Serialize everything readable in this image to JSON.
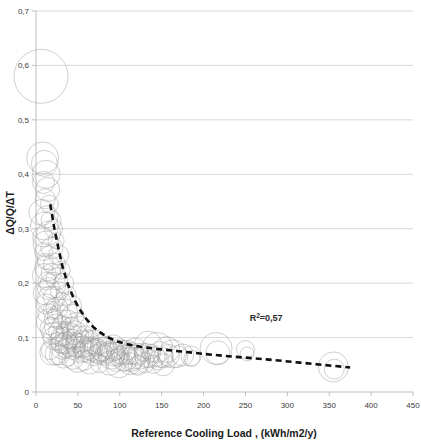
{
  "chart_data": {
    "type": "scatter",
    "title": "",
    "xlabel": "Reference Cooling Load , (kWh/m2/y)",
    "ylabel": "ΔQ/Q/ΔT",
    "xlim": [
      0,
      450
    ],
    "ylim": [
      0,
      0.7
    ],
    "xticks": [
      "0",
      "50",
      "100",
      "150",
      "200",
      "250",
      "300",
      "350",
      "400",
      "450"
    ],
    "xtick_values": [
      0,
      50,
      100,
      150,
      200,
      250,
      300,
      350,
      400,
      450
    ],
    "yticks": [
      "0",
      "0,1",
      "0,2",
      "0,3",
      "0,4",
      "0,5",
      "0,6",
      "0,7"
    ],
    "ytick_values": [
      0,
      0.1,
      0.2,
      0.3,
      0.4,
      0.5,
      0.6,
      0.7
    ],
    "grid": "horizontal",
    "legend": "none",
    "marker_style": "open-circle-outline",
    "marker_color": "#9a9a9a",
    "annotations": [
      {
        "text": "R²=0,57",
        "x": 255,
        "y": 0.13,
        "base": "R",
        "sup": "2",
        "rest": "=0,57"
      }
    ],
    "trendline": {
      "style": "dashed",
      "color": "#111111",
      "label": "power-law decay fit",
      "points": [
        [
          17,
          0.345
        ],
        [
          22,
          0.3
        ],
        [
          27,
          0.262
        ],
        [
          32,
          0.228
        ],
        [
          38,
          0.198
        ],
        [
          45,
          0.172
        ],
        [
          52,
          0.152
        ],
        [
          60,
          0.134
        ],
        [
          68,
          0.12
        ],
        [
          76,
          0.11
        ],
        [
          85,
          0.101
        ],
        [
          95,
          0.094
        ],
        [
          108,
          0.088
        ],
        [
          125,
          0.083
        ],
        [
          145,
          0.079
        ],
        [
          170,
          0.075
        ],
        [
          200,
          0.07
        ],
        [
          235,
          0.065
        ],
        [
          275,
          0.06
        ],
        [
          315,
          0.054
        ],
        [
          355,
          0.048
        ],
        [
          375,
          0.045
        ]
      ]
    },
    "series": [
      {
        "name": "Buildings",
        "x_label": "Reference Cooling Load (kWh/m2/y)",
        "y_label": "ΔQ/Q/ΔT",
        "points": [
          [
            6,
            0.58,
            27
          ],
          [
            8,
            0.43,
            16
          ],
          [
            10,
            0.42,
            13
          ],
          [
            12,
            0.4,
            14
          ],
          [
            9,
            0.385,
            11
          ],
          [
            14,
            0.372,
            12
          ],
          [
            11,
            0.355,
            10
          ],
          [
            16,
            0.345,
            9
          ],
          [
            7,
            0.33,
            13
          ],
          [
            13,
            0.322,
            11
          ],
          [
            18,
            0.315,
            10
          ],
          [
            10,
            0.305,
            14
          ],
          [
            21,
            0.3,
            9
          ],
          [
            15,
            0.292,
            12
          ],
          [
            8,
            0.285,
            10
          ],
          [
            24,
            0.278,
            8
          ],
          [
            12,
            0.272,
            13
          ],
          [
            19,
            0.265,
            11
          ],
          [
            9,
            0.258,
            9
          ],
          [
            27,
            0.252,
            10
          ],
          [
            16,
            0.246,
            12
          ],
          [
            11,
            0.24,
            8
          ],
          [
            22,
            0.235,
            11
          ],
          [
            14,
            0.228,
            13
          ],
          [
            30,
            0.224,
            9
          ],
          [
            18,
            0.218,
            10
          ],
          [
            10,
            0.214,
            12
          ],
          [
            25,
            0.208,
            11
          ],
          [
            13,
            0.204,
            9
          ],
          [
            33,
            0.2,
            10
          ],
          [
            20,
            0.196,
            13
          ],
          [
            15,
            0.19,
            11
          ],
          [
            28,
            0.186,
            9
          ],
          [
            11,
            0.182,
            12
          ],
          [
            36,
            0.178,
            10
          ],
          [
            22,
            0.174,
            11
          ],
          [
            17,
            0.17,
            13
          ],
          [
            31,
            0.166,
            9
          ],
          [
            12,
            0.162,
            10
          ],
          [
            40,
            0.158,
            12
          ],
          [
            25,
            0.154,
            11
          ],
          [
            19,
            0.15,
            9
          ],
          [
            34,
            0.147,
            13
          ],
          [
            14,
            0.144,
            10
          ],
          [
            44,
            0.141,
            11
          ],
          [
            28,
            0.138,
            12
          ],
          [
            21,
            0.135,
            9
          ],
          [
            38,
            0.132,
            10
          ],
          [
            16,
            0.129,
            13
          ],
          [
            48,
            0.126,
            11
          ],
          [
            31,
            0.124,
            9
          ],
          [
            24,
            0.121,
            12
          ],
          [
            42,
            0.119,
            10
          ],
          [
            18,
            0.117,
            11
          ],
          [
            53,
            0.115,
            13
          ],
          [
            35,
            0.113,
            9
          ],
          [
            27,
            0.111,
            10
          ],
          [
            46,
            0.109,
            12
          ],
          [
            20,
            0.107,
            11
          ],
          [
            58,
            0.105,
            9
          ],
          [
            39,
            0.104,
            13
          ],
          [
            30,
            0.102,
            10
          ],
          [
            50,
            0.101,
            11
          ],
          [
            23,
            0.099,
            12
          ],
          [
            64,
            0.098,
            9
          ],
          [
            43,
            0.097,
            10
          ],
          [
            33,
            0.095,
            13
          ],
          [
            55,
            0.094,
            11
          ],
          [
            26,
            0.093,
            9
          ],
          [
            70,
            0.092,
            12
          ],
          [
            47,
            0.091,
            10
          ],
          [
            36,
            0.09,
            11
          ],
          [
            60,
            0.089,
            13
          ],
          [
            29,
            0.088,
            9
          ],
          [
            77,
            0.087,
            10
          ],
          [
            51,
            0.086,
            12
          ],
          [
            40,
            0.085,
            11
          ],
          [
            66,
            0.085,
            9
          ],
          [
            32,
            0.084,
            13
          ],
          [
            84,
            0.083,
            10
          ],
          [
            56,
            0.083,
            11
          ],
          [
            44,
            0.082,
            12
          ],
          [
            72,
            0.082,
            9
          ],
          [
            35,
            0.081,
            10
          ],
          [
            92,
            0.081,
            13
          ],
          [
            61,
            0.08,
            11
          ],
          [
            48,
            0.08,
            9
          ],
          [
            79,
            0.079,
            12
          ],
          [
            100,
            0.079,
            10
          ],
          [
            66,
            0.078,
            11
          ],
          [
            53,
            0.078,
            13
          ],
          [
            87,
            0.077,
            9
          ],
          [
            109,
            0.077,
            10
          ],
          [
            72,
            0.076,
            12
          ],
          [
            58,
            0.076,
            11
          ],
          [
            95,
            0.075,
            9
          ],
          [
            118,
            0.075,
            13
          ],
          [
            78,
            0.074,
            10
          ],
          [
            63,
            0.074,
            11
          ],
          [
            104,
            0.073,
            12
          ],
          [
            128,
            0.073,
            9
          ],
          [
            85,
            0.072,
            10
          ],
          [
            69,
            0.072,
            13
          ],
          [
            113,
            0.071,
            11
          ],
          [
            138,
            0.071,
            9
          ],
          [
            92,
            0.07,
            12
          ],
          [
            75,
            0.07,
            10
          ],
          [
            122,
            0.069,
            11
          ],
          [
            148,
            0.069,
            13
          ],
          [
            100,
            0.068,
            9
          ],
          [
            82,
            0.068,
            10
          ],
          [
            132,
            0.067,
            12
          ],
          [
            158,
            0.067,
            11
          ],
          [
            108,
            0.066,
            9
          ],
          [
            90,
            0.066,
            13
          ],
          [
            142,
            0.065,
            10
          ],
          [
            168,
            0.065,
            11
          ],
          [
            116,
            0.064,
            12
          ],
          [
            98,
            0.064,
            9
          ],
          [
            152,
            0.063,
            10
          ],
          [
            106,
            0.062,
            13
          ],
          [
            124,
            0.062,
            11
          ],
          [
            136,
            0.061,
            9
          ],
          [
            114,
            0.06,
            12
          ],
          [
            146,
            0.059,
            10
          ],
          [
            96,
            0.058,
            11
          ],
          [
            120,
            0.057,
            13
          ],
          [
            105,
            0.055,
            9
          ],
          [
            130,
            0.054,
            10
          ],
          [
            88,
            0.053,
            12
          ],
          [
            112,
            0.052,
            11
          ],
          [
            140,
            0.051,
            9
          ],
          [
            99,
            0.05,
            13
          ],
          [
            122,
            0.049,
            10
          ],
          [
            152,
            0.05,
            11
          ],
          [
            76,
            0.052,
            9
          ],
          [
            64,
            0.055,
            12
          ],
          [
            57,
            0.058,
            10
          ],
          [
            50,
            0.06,
            13
          ],
          [
            44,
            0.062,
            11
          ],
          [
            38,
            0.064,
            9
          ],
          [
            33,
            0.066,
            12
          ],
          [
            28,
            0.068,
            10
          ],
          [
            24,
            0.07,
            11
          ],
          [
            20,
            0.073,
            13
          ],
          [
            17,
            0.076,
            9
          ],
          [
            185,
            0.066,
            10
          ],
          [
            186,
            0.062,
            8
          ],
          [
            215,
            0.08,
            16
          ],
          [
            217,
            0.072,
            12
          ],
          [
            250,
            0.078,
            9
          ],
          [
            252,
            0.07,
            7
          ],
          [
            355,
            0.046,
            15
          ],
          [
            356,
            0.042,
            10
          ],
          [
            163,
            0.07,
            14
          ],
          [
            175,
            0.068,
            11
          ],
          [
            145,
            0.082,
            15
          ],
          [
            134,
            0.086,
            14
          ],
          [
            156,
            0.078,
            13
          ]
        ]
      }
    ]
  },
  "axis": {
    "x_title": "Reference Cooling Load , (kWh/m2/y)",
    "y_title": "ΔQ/Q/ΔT"
  }
}
